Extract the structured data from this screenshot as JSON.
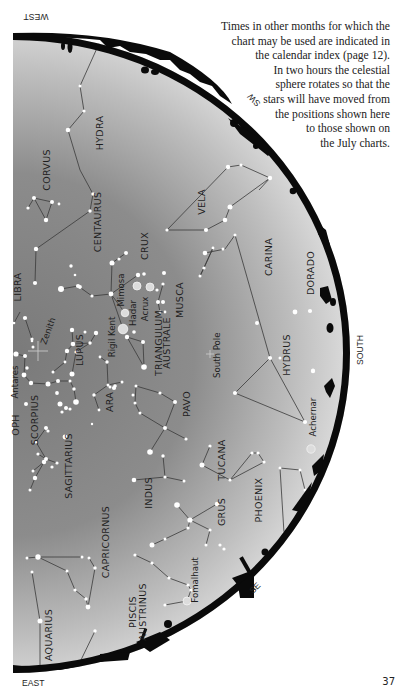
{
  "caption": {
    "lines": [
      "Times in other months for which the",
      "chart may be used are indicated in",
      "the calendar index (page 12).",
      "In two hours the celestial",
      "sphere rotates so that the",
      "stars will have moved from",
      "the positions shown here",
      "to those shown on",
      "the July charts."
    ]
  },
  "page_number": "37",
  "directions": {
    "west": "WEST",
    "sw": "SW",
    "south": "SOUTH",
    "se": "SE",
    "east": "EAST"
  },
  "markers": {
    "zenith": "Zenith",
    "south_pole": "South Pole"
  },
  "constellations": [
    {
      "name": "HYDRA",
      "x": 103,
      "y": 133
    },
    {
      "name": "CORVUS",
      "x": 50,
      "y": 170
    },
    {
      "name": "VELA",
      "x": 205,
      "y": 202
    },
    {
      "name": "CENTAURUS",
      "x": 101,
      "y": 222
    },
    {
      "name": "CRUX",
      "x": 148,
      "y": 246
    },
    {
      "name": "CARINA",
      "x": 272,
      "y": 257
    },
    {
      "name": "DORADO",
      "x": 314,
      "y": 273
    },
    {
      "name": "LIBRA",
      "x": 21,
      "y": 287
    },
    {
      "name": "MUSCA",
      "x": 183,
      "y": 300
    },
    {
      "name": "LUPUS",
      "x": 83,
      "y": 350
    },
    {
      "name": "TRIANGULUM",
      "x": 162,
      "y": 343
    },
    {
      "name": "AUSTRALE",
      "x": 170,
      "y": 343
    },
    {
      "name": "HYDRUS",
      "x": 290,
      "y": 355
    },
    {
      "name": "OPH",
      "x": 19,
      "y": 425
    },
    {
      "name": "SCORPIUS",
      "x": 38,
      "y": 420
    },
    {
      "name": "ARA",
      "x": 113,
      "y": 402
    },
    {
      "name": "PAVO",
      "x": 190,
      "y": 404
    },
    {
      "name": "TUCANA",
      "x": 225,
      "y": 460
    },
    {
      "name": "SAGITTARIUS",
      "x": 72,
      "y": 466
    },
    {
      "name": "INDUS",
      "x": 152,
      "y": 493
    },
    {
      "name": "GRUS",
      "x": 225,
      "y": 512
    },
    {
      "name": "PHOENIX",
      "x": 262,
      "y": 500
    },
    {
      "name": "CAPRICORNUS",
      "x": 109,
      "y": 542
    },
    {
      "name": "PISCIS",
      "x": 136,
      "y": 612
    },
    {
      "name": "AUSTRINUS",
      "x": 146,
      "y": 612
    },
    {
      "name": "AQUARIUS",
      "x": 52,
      "y": 635
    }
  ],
  "named_stars": [
    {
      "name": "Mimosa",
      "x": 124,
      "y": 290
    },
    {
      "name": "Hadar",
      "x": 136,
      "y": 313
    },
    {
      "name": "Acrux",
      "x": 148,
      "y": 309
    },
    {
      "name": "Rigil Kent",
      "x": 115,
      "y": 337
    },
    {
      "name": "Antares",
      "x": 18,
      "y": 382
    },
    {
      "name": "Achernar",
      "x": 316,
      "y": 417
    },
    {
      "name": "Fomalhaut",
      "x": 198,
      "y": 580
    }
  ],
  "stars": [
    [
      102,
      37,
      1.3
    ],
    [
      80,
      86,
      1.5
    ],
    [
      84,
      111,
      1.6
    ],
    [
      68,
      130,
      2.3
    ],
    [
      93,
      194,
      1.7
    ],
    [
      90,
      211,
      1.7
    ],
    [
      34,
      198,
      2
    ],
    [
      28,
      208,
      1.6
    ],
    [
      46,
      220,
      2.2
    ],
    [
      52,
      202,
      2
    ],
    [
      59,
      204,
      1.4
    ],
    [
      36,
      249,
      2.2
    ],
    [
      35,
      283,
      2.1
    ],
    [
      25,
      318,
      2.1
    ],
    [
      32,
      339,
      1.6
    ],
    [
      14,
      323,
      1.3
    ],
    [
      71,
      266,
      1.7
    ],
    [
      75,
      275,
      1.3
    ],
    [
      61,
      289,
      3
    ],
    [
      78,
      286,
      2.1
    ],
    [
      80,
      287,
      1.9
    ],
    [
      92,
      296,
      1.6
    ],
    [
      111,
      294,
      2.4
    ],
    [
      112,
      263,
      2.5
    ],
    [
      119,
      259,
      1.6
    ],
    [
      126,
      253,
      2
    ],
    [
      138,
      275,
      2.2
    ],
    [
      144,
      274,
      1.8
    ],
    [
      137,
      286,
      4
    ],
    [
      150,
      287,
      4
    ],
    [
      125,
      313,
      3.8
    ],
    [
      123,
      329,
      4.8
    ],
    [
      134,
      332,
      1.8
    ],
    [
      163,
      284,
      1.6
    ],
    [
      157,
      290,
      1.6
    ],
    [
      158,
      302,
      2
    ],
    [
      163,
      302,
      2
    ],
    [
      160,
      312,
      1.4
    ],
    [
      165,
      312,
      1.4
    ],
    [
      164,
      273,
      2
    ],
    [
      72,
      330,
      2.2
    ],
    [
      73,
      344,
      2.3
    ],
    [
      67,
      351,
      2.2
    ],
    [
      90,
      343,
      1.7
    ],
    [
      76,
      352,
      1.6
    ],
    [
      96,
      333,
      2.2
    ],
    [
      72,
      374,
      2.5
    ],
    [
      53,
      372,
      1.5
    ],
    [
      85,
      332,
      1.5
    ],
    [
      65,
      362,
      1.4
    ],
    [
      57,
      393,
      1.9
    ],
    [
      16,
      354,
      2.6
    ],
    [
      25,
      356,
      2
    ],
    [
      33,
      347,
      1.5
    ],
    [
      32,
      341,
      1.3
    ],
    [
      24,
      375,
      2.4
    ],
    [
      31,
      383,
      2.2
    ],
    [
      27,
      368,
      1.7
    ],
    [
      48,
      384,
      2.5
    ],
    [
      58,
      381,
      2
    ],
    [
      70,
      381,
      1.5
    ],
    [
      74,
      389,
      1.7
    ],
    [
      76,
      402,
      2.8
    ],
    [
      60,
      404,
      2.5
    ],
    [
      66,
      408,
      2
    ],
    [
      70,
      409,
      1.6
    ],
    [
      62,
      412,
      1.6
    ],
    [
      26,
      404,
      2
    ],
    [
      92,
      424,
      1.2
    ],
    [
      100,
      357,
      1.4
    ],
    [
      107,
      362,
      1.7
    ],
    [
      108,
      385,
      1.5
    ],
    [
      110,
      387,
      1.5
    ],
    [
      115,
      386,
      1.8
    ],
    [
      114,
      388,
      2.1
    ],
    [
      122,
      382,
      1.5
    ],
    [
      94,
      395,
      1.7
    ],
    [
      99,
      410,
      1.4
    ],
    [
      127,
      337,
      2.2
    ],
    [
      143,
      342,
      2
    ],
    [
      144,
      367,
      2.8
    ],
    [
      136,
      386,
      1.5
    ],
    [
      133,
      395,
      1.5
    ],
    [
      135,
      403,
      1.5
    ],
    [
      140,
      413,
      1.5
    ],
    [
      160,
      393,
      1.6
    ],
    [
      175,
      402,
      2
    ],
    [
      165,
      428,
      2
    ],
    [
      186,
      439,
      1.6
    ],
    [
      150,
      452,
      2.8
    ],
    [
      163,
      456,
      1.7
    ],
    [
      165,
      477,
      1.6
    ],
    [
      134,
      480,
      2.3
    ],
    [
      184,
      481,
      1.5
    ],
    [
      46,
      428,
      2
    ],
    [
      48,
      431,
      1.6
    ],
    [
      65,
      437,
      2.4
    ],
    [
      36,
      442,
      1.6
    ],
    [
      38,
      454,
      1.6
    ],
    [
      46,
      459,
      2
    ],
    [
      44,
      462,
      2.2
    ],
    [
      52,
      467,
      1.6
    ],
    [
      57,
      463,
      1.6
    ],
    [
      33,
      471,
      1.5
    ],
    [
      35,
      478,
      2.2
    ],
    [
      30,
      490,
      1.5
    ],
    [
      270,
      178,
      2.2
    ],
    [
      230,
      207,
      2.5
    ],
    [
      206,
      230,
      2.1
    ],
    [
      228,
      167,
      2.2
    ],
    [
      225,
      220,
      2.3
    ],
    [
      205,
      253,
      2.3
    ],
    [
      213,
      248,
      1.4
    ],
    [
      200,
      276,
      1.5
    ],
    [
      167,
      230,
      1.6
    ],
    [
      204,
      268,
      1.6
    ],
    [
      223,
      249,
      1.5
    ],
    [
      235,
      235,
      1.5
    ],
    [
      241,
      165,
      1.6
    ],
    [
      257,
      323,
      2
    ],
    [
      280,
      358,
      1.5
    ],
    [
      270,
      358,
      2.1
    ],
    [
      235,
      393,
      2.1
    ],
    [
      305,
      422,
      2.1
    ],
    [
      295,
      312,
      2.4
    ],
    [
      310,
      311,
      2.1
    ],
    [
      313,
      371,
      2.2
    ],
    [
      313,
      370,
      1.6
    ],
    [
      311,
      449,
      4.2
    ],
    [
      202,
      465,
      2.5
    ],
    [
      210,
      446,
      1.6
    ],
    [
      230,
      480,
      1.6
    ],
    [
      252,
      453,
      1.6
    ],
    [
      258,
      453,
      1.6
    ],
    [
      264,
      462,
      1.6
    ],
    [
      280,
      468,
      1.5
    ],
    [
      300,
      470,
      1.5
    ],
    [
      305,
      490,
      1.5
    ],
    [
      177,
      505,
      2.8
    ],
    [
      190,
      520,
      2.6
    ],
    [
      210,
      530,
      1.6
    ],
    [
      206,
      545,
      1.5
    ],
    [
      188,
      528,
      1.6
    ],
    [
      165,
      539,
      1.5
    ],
    [
      152,
      545,
      2.5
    ],
    [
      217,
      504,
      2.2
    ],
    [
      224,
      549,
      1.6
    ],
    [
      284,
      533,
      1.5
    ],
    [
      27,
      558,
      1.5
    ],
    [
      38,
      557,
      2.7
    ],
    [
      82,
      557,
      1.5
    ],
    [
      89,
      558,
      1.5
    ],
    [
      67,
      571,
      1.5
    ],
    [
      75,
      590,
      1.6
    ],
    [
      95,
      568,
      1.7
    ],
    [
      86,
      599,
      1.7
    ],
    [
      88,
      607,
      2.4
    ],
    [
      95,
      631,
      1.7
    ],
    [
      32,
      572,
      1.5
    ],
    [
      40,
      621,
      2.5
    ],
    [
      80,
      662,
      1.5
    ],
    [
      135,
      555,
      1.6
    ],
    [
      152,
      563,
      1.6
    ],
    [
      169,
      578,
      1.6
    ],
    [
      188,
      585,
      1.6
    ],
    [
      191,
      590,
      1.6
    ],
    [
      187,
      601,
      4
    ],
    [
      165,
      605,
      1.6
    ],
    [
      220,
      545,
      1.6
    ]
  ],
  "lines": [
    [
      102,
      37,
      80,
      86
    ],
    [
      80,
      86,
      84,
      111
    ],
    [
      84,
      111,
      68,
      130
    ],
    [
      68,
      130,
      80,
      170
    ],
    [
      80,
      170,
      93,
      194
    ],
    [
      93,
      194,
      90,
      211
    ],
    [
      90,
      211,
      36,
      249
    ],
    [
      36,
      249,
      35,
      283
    ],
    [
      34,
      198,
      46,
      220
    ],
    [
      46,
      220,
      52,
      202
    ],
    [
      52,
      202,
      34,
      198
    ],
    [
      28,
      208,
      34,
      198
    ],
    [
      61,
      289,
      78,
      286
    ],
    [
      78,
      286,
      92,
      296
    ],
    [
      92,
      296,
      111,
      294
    ],
    [
      111,
      294,
      112,
      263
    ],
    [
      112,
      263,
      126,
      253
    ],
    [
      111,
      294,
      125,
      313
    ],
    [
      111,
      294,
      123,
      329
    ],
    [
      111,
      294,
      138,
      275
    ],
    [
      158,
      302,
      160,
      312
    ],
    [
      158,
      302,
      163,
      284
    ],
    [
      160,
      312,
      165,
      312
    ],
    [
      72,
      330,
      73,
      344
    ],
    [
      73,
      344,
      67,
      351
    ],
    [
      73,
      344,
      90,
      343
    ],
    [
      90,
      343,
      96,
      333
    ],
    [
      90,
      343,
      76,
      352
    ],
    [
      76,
      352,
      72,
      374
    ],
    [
      53,
      372,
      65,
      362
    ],
    [
      65,
      362,
      67,
      351
    ],
    [
      25,
      318,
      32,
      339
    ],
    [
      16,
      354,
      25,
      356
    ],
    [
      25,
      356,
      24,
      375
    ],
    [
      24,
      375,
      31,
      383
    ],
    [
      31,
      383,
      48,
      384
    ],
    [
      48,
      384,
      58,
      381
    ],
    [
      58,
      381,
      70,
      381
    ],
    [
      70,
      381,
      74,
      389
    ],
    [
      74,
      389,
      76,
      402
    ],
    [
      14,
      323,
      20,
      312
    ],
    [
      100,
      357,
      107,
      362
    ],
    [
      107,
      362,
      108,
      385
    ],
    [
      94,
      395,
      108,
      385
    ],
    [
      108,
      385,
      122,
      382
    ],
    [
      94,
      395,
      99,
      410
    ],
    [
      127,
      337,
      143,
      342
    ],
    [
      143,
      342,
      144,
      367
    ],
    [
      144,
      367,
      127,
      337
    ],
    [
      136,
      386,
      135,
      403
    ],
    [
      135,
      403,
      140,
      413
    ],
    [
      136,
      386,
      160,
      393
    ],
    [
      160,
      393,
      175,
      402
    ],
    [
      175,
      402,
      165,
      428
    ],
    [
      140,
      413,
      165,
      428
    ],
    [
      165,
      428,
      186,
      439
    ],
    [
      165,
      428,
      150,
      452
    ],
    [
      165,
      477,
      163,
      456
    ],
    [
      165,
      477,
      134,
      480
    ],
    [
      165,
      477,
      184,
      481
    ],
    [
      46,
      428,
      36,
      442
    ],
    [
      36,
      442,
      46,
      459
    ],
    [
      46,
      459,
      57,
      463
    ],
    [
      46,
      459,
      38,
      454
    ],
    [
      33,
      471,
      44,
      462
    ],
    [
      35,
      478,
      30,
      490
    ],
    [
      35,
      478,
      44,
      462
    ],
    [
      228,
      167,
      241,
      165
    ],
    [
      241,
      165,
      270,
      178
    ],
    [
      270,
      178,
      230,
      207
    ],
    [
      230,
      207,
      225,
      220
    ],
    [
      225,
      220,
      206,
      230
    ],
    [
      206,
      230,
      167,
      230
    ],
    [
      167,
      230,
      228,
      167
    ],
    [
      270,
      178,
      259,
      190
    ],
    [
      205,
      253,
      225,
      249
    ],
    [
      225,
      249,
      235,
      235
    ],
    [
      235,
      235,
      270,
      358
    ],
    [
      200,
      276,
      204,
      268
    ],
    [
      200,
      276,
      213,
      248
    ],
    [
      213,
      248,
      204,
      268
    ],
    [
      235,
      393,
      270,
      358
    ],
    [
      270,
      358,
      305,
      422
    ],
    [
      305,
      422,
      235,
      393
    ],
    [
      202,
      465,
      210,
      446
    ],
    [
      202,
      465,
      230,
      480
    ],
    [
      230,
      480,
      252,
      453
    ],
    [
      230,
      480,
      264,
      462
    ],
    [
      252,
      453,
      258,
      453
    ],
    [
      258,
      453,
      264,
      462
    ],
    [
      177,
      505,
      190,
      520
    ],
    [
      190,
      520,
      217,
      504
    ],
    [
      190,
      520,
      188,
      528
    ],
    [
      188,
      528,
      165,
      539
    ],
    [
      165,
      539,
      152,
      545
    ],
    [
      190,
      520,
      210,
      530
    ],
    [
      210,
      530,
      206,
      545
    ],
    [
      284,
      533,
      280,
      468
    ],
    [
      280,
      468,
      300,
      470
    ],
    [
      300,
      470,
      305,
      490
    ],
    [
      27,
      558,
      38,
      557
    ],
    [
      38,
      557,
      82,
      557
    ],
    [
      38,
      557,
      67,
      571
    ],
    [
      67,
      571,
      75,
      590
    ],
    [
      75,
      590,
      86,
      599
    ],
    [
      86,
      599,
      88,
      607
    ],
    [
      88,
      607,
      95,
      568
    ],
    [
      95,
      568,
      89,
      558
    ],
    [
      32,
      572,
      40,
      621
    ],
    [
      40,
      621,
      40,
      666
    ],
    [
      95,
      631,
      80,
      662
    ],
    [
      135,
      555,
      152,
      563
    ],
    [
      152,
      563,
      169,
      578
    ],
    [
      169,
      578,
      188,
      585
    ],
    [
      188,
      585,
      191,
      590
    ],
    [
      191,
      590,
      187,
      601
    ],
    [
      187,
      601,
      165,
      605
    ]
  ],
  "colors": {
    "sky_light": "#d4d4d4",
    "sky_dark": "#727272",
    "horizon": "#0a0a0a",
    "star": "#ffffff",
    "bright_star": "#dcdcdc",
    "line": "#3a3a3a"
  }
}
